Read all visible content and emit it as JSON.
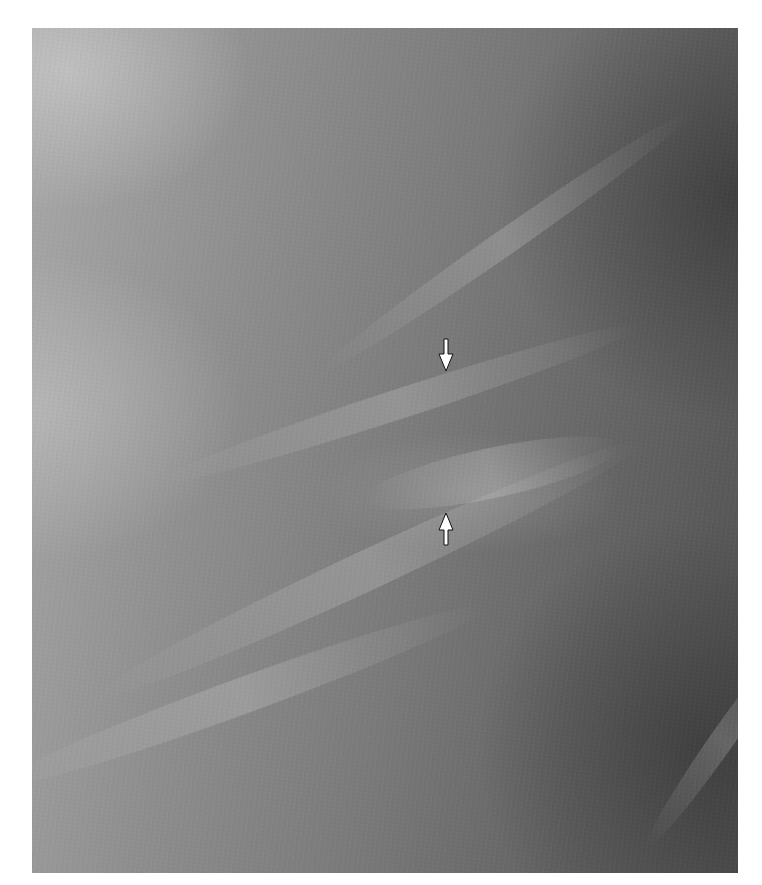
{
  "image": {
    "kind": "grayscale mammogram detail",
    "background": "#ffffff",
    "tone_light": "#a9a9a9",
    "tone_dark": "#525252"
  },
  "annotations": {
    "arrows": [
      {
        "name": "arrow-pointing-down",
        "direction": "down",
        "x": 446,
        "y": 354,
        "color": "#ffffff"
      },
      {
        "name": "arrow-pointing-up",
        "direction": "up",
        "x": 446,
        "y": 528,
        "color": "#ffffff"
      }
    ]
  }
}
